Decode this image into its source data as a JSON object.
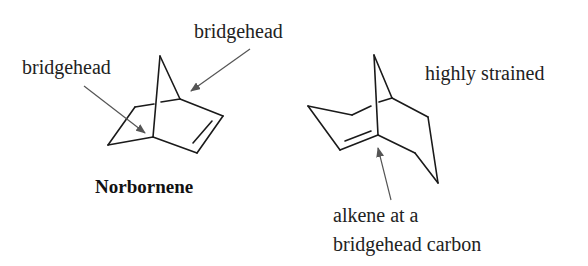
{
  "labels": {
    "bridgehead_top": "bridgehead",
    "bridgehead_left": "bridgehead",
    "norbornene_name": "Norbornene",
    "highly_strained": "highly strained",
    "alkene_line1": "alkene at a",
    "alkene_line2": "bridgehead carbon"
  },
  "colors": {
    "bond": "#1a1a1a",
    "arrow": "#555555",
    "text": "#222222",
    "background": "#ffffff"
  },
  "molecules": [
    {
      "name": "Norbornene",
      "description": "bicyclo[2.2.1]hept-2-ene with two labeled bridgehead carbons"
    },
    {
      "name": "bridgehead alkene",
      "description": "bicyclic alkene with double bond at bridgehead carbon, labeled highly strained"
    }
  ]
}
